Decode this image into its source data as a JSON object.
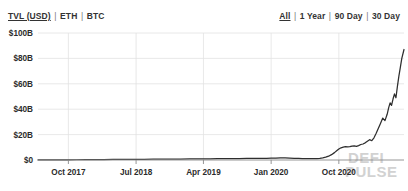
{
  "header": {
    "metric_toggles": [
      {
        "label": "TVL (USD)",
        "active": true
      },
      {
        "label": "ETH",
        "active": false
      },
      {
        "label": "BTC",
        "active": false
      }
    ],
    "range_toggles": [
      {
        "label": "All",
        "active": true
      },
      {
        "label": "1 Year",
        "active": false
      },
      {
        "label": "90 Day",
        "active": false
      },
      {
        "label": "30 Day",
        "active": false
      }
    ],
    "separator": "|"
  },
  "watermark": {
    "line1": "DEFI",
    "line2": "PULSE"
  },
  "colors": {
    "line": "#2e2e2e",
    "grid": "#e2e2e2",
    "axis": "#8a8a8a",
    "text": "#2b2b2b",
    "watermark": "#d2d2d2",
    "background": "#ffffff"
  },
  "chart_data": {
    "type": "line",
    "title": "",
    "xlabel": "",
    "ylabel": "TVL (USD)",
    "grid": true,
    "legend": "none",
    "ylim": [
      0,
      100
    ],
    "yunit": "B",
    "ytick_labels": [
      "$0",
      "$20B",
      "$40B",
      "$60B",
      "$80B",
      "$100B"
    ],
    "ytick_values": [
      0,
      20,
      40,
      60,
      80,
      100
    ],
    "xtick_labels": [
      "Oct 2017",
      "Jul 2018",
      "Apr 2019",
      "Jan 2020",
      "Oct 2020"
    ],
    "xtick_positions": [
      0.083,
      0.268,
      0.452,
      0.637,
      0.822
    ],
    "x_domain_labels": [
      "Aug 2017",
      "Jan 2021"
    ],
    "series": [
      {
        "name": "Total Value Locked (USD)",
        "x": [
          0.0,
          0.02,
          0.04,
          0.06,
          0.083,
          0.105,
          0.13,
          0.155,
          0.18,
          0.205,
          0.23,
          0.25,
          0.268,
          0.29,
          0.315,
          0.34,
          0.365,
          0.39,
          0.415,
          0.435,
          0.452,
          0.47,
          0.49,
          0.51,
          0.53,
          0.55,
          0.57,
          0.59,
          0.61,
          0.625,
          0.637,
          0.65,
          0.662,
          0.675,
          0.688,
          0.7,
          0.712,
          0.722,
          0.732,
          0.742,
          0.752,
          0.762,
          0.77,
          0.778,
          0.786,
          0.794,
          0.802,
          0.81,
          0.816,
          0.822,
          0.828,
          0.834,
          0.84,
          0.846,
          0.852,
          0.858,
          0.864,
          0.87,
          0.876,
          0.882,
          0.888,
          0.894,
          0.9,
          0.906,
          0.912,
          0.918,
          0.924,
          0.93,
          0.936,
          0.942,
          0.948,
          0.954,
          0.958,
          0.962,
          0.966,
          0.97,
          0.974,
          0.978,
          0.982,
          0.986,
          0.99,
          0.994,
          1.0
        ],
        "y": [
          0.05,
          0.08,
          0.1,
          0.12,
          0.15,
          0.2,
          0.25,
          0.3,
          0.35,
          0.4,
          0.45,
          0.48,
          0.5,
          0.55,
          0.6,
          0.65,
          0.7,
          0.75,
          0.8,
          0.85,
          0.9,
          0.95,
          1.0,
          1.05,
          1.1,
          1.15,
          1.2,
          1.25,
          1.3,
          1.35,
          1.4,
          1.5,
          1.7,
          1.6,
          1.45,
          1.3,
          1.2,
          1.15,
          1.1,
          1.05,
          1.0,
          1.05,
          1.2,
          1.6,
          2.2,
          3.0,
          4.2,
          5.8,
          7.2,
          8.6,
          9.6,
          10.2,
          10.6,
          10.3,
          10.5,
          11.0,
          11.2,
          10.8,
          11.3,
          12.2,
          12.6,
          13.5,
          14.8,
          16.0,
          15.2,
          17.5,
          21.0,
          25.0,
          29.0,
          33.0,
          31.0,
          36.0,
          41.0,
          45.0,
          43.0,
          48.0,
          52.0,
          49.0,
          58.0,
          66.0,
          73.0,
          80.0,
          87.0
        ],
        "peak_value": 87,
        "final_value": 57,
        "approx": true
      }
    ]
  }
}
